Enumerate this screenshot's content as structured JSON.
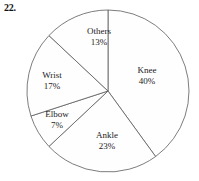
{
  "figure": {
    "question_number": "22.",
    "caption": ""
  },
  "chart_data": {
    "type": "pie",
    "title": "",
    "xlabel": "",
    "ylabel": "",
    "legend": "none",
    "grid": false,
    "start_angle_deg": 0,
    "direction": "clockwise",
    "categories": [
      "Knee",
      "Ankle",
      "Elbow",
      "Wrist",
      "Others"
    ],
    "values": [
      40,
      23,
      7,
      17,
      13
    ],
    "units": "percent",
    "labels": [
      {
        "name": "Knee",
        "pct": "40%",
        "value": 40,
        "label_x": 147,
        "label_y": 75
      },
      {
        "name": "Ankle",
        "pct": "23%",
        "value": 23,
        "label_x": 107,
        "label_y": 140
      },
      {
        "name": "Elbow",
        "pct": "7%",
        "value": 7,
        "label_x": 57,
        "label_y": 119
      },
      {
        "name": "Wrist",
        "pct": "17%",
        "value": 17,
        "label_x": 52,
        "label_y": 80
      },
      {
        "name": "Others",
        "pct": "13%",
        "value": 13,
        "label_x": 99,
        "label_y": 36
      }
    ],
    "geometry": {
      "center_x": 108,
      "center_y": 91,
      "radius": 81
    },
    "colors": {
      "slice_fill": "#fefefe",
      "slice_stroke": "#5c5c5c",
      "background": "#ffffff",
      "text": "#1a1a1a"
    }
  }
}
